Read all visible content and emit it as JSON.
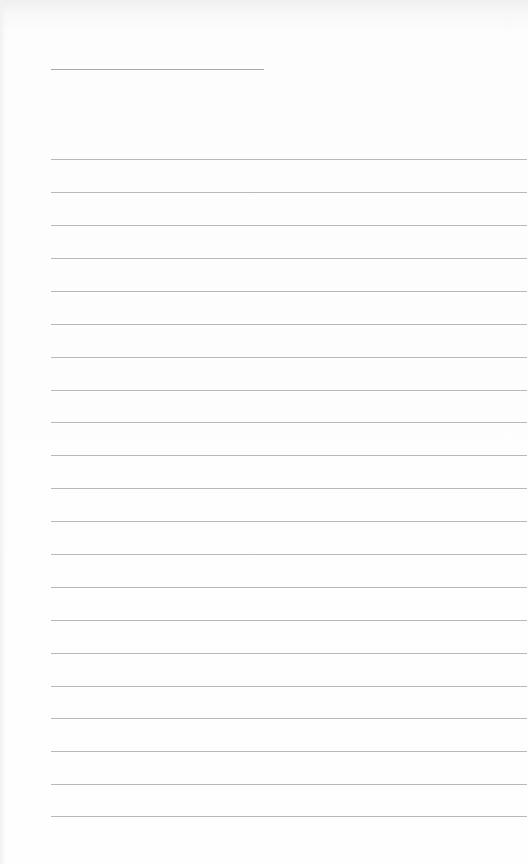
{
  "page": {
    "type": "blank lined notepad sheet",
    "background_color": "#fdfdfd",
    "line_color": "#a8a8a8"
  },
  "header_rule": {
    "x_start": 51,
    "x_end": 264,
    "y": 69
  },
  "ruled_lines": {
    "x_start": 51,
    "x_end": 527,
    "spacing": 33,
    "positions": [
      159,
      192,
      225,
      258,
      291,
      324,
      357,
      390,
      422,
      455,
      488,
      521,
      554,
      587,
      620,
      653,
      686,
      718,
      751,
      784,
      816
    ]
  }
}
